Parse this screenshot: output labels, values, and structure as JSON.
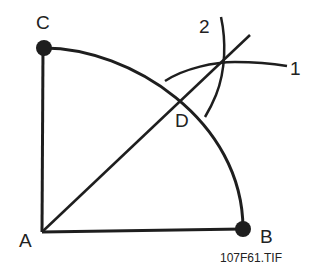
{
  "diagram": {
    "labels": {
      "a": "A",
      "b": "B",
      "c": "C",
      "d": "D",
      "arc1": "1",
      "arc2": "2"
    },
    "caption": "107F61.TIF",
    "stroke_color": "#1e1e1e"
  }
}
